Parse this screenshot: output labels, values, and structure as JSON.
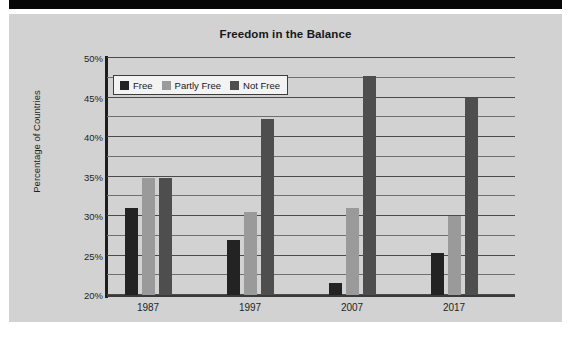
{
  "chart_data": {
    "type": "bar",
    "title": "Freedom in the Balance",
    "xlabel": "",
    "ylabel": "Percentage of Countries",
    "categories": [
      "1987",
      "1997",
      "2007",
      "2017"
    ],
    "series": [
      {
        "name": "Free",
        "color": "#232323",
        "values": [
          31.0,
          27.0,
          21.5,
          25.3
        ]
      },
      {
        "name": "Partly Free",
        "color": "#9a9a9a",
        "values": [
          34.8,
          30.5,
          31.0,
          30.0
        ]
      },
      {
        "name": "Not Free",
        "color": "#4e4e4e",
        "values": [
          34.8,
          42.3,
          47.7,
          45.0
        ]
      }
    ],
    "ylim": [
      20,
      50
    ],
    "ytick_labels": [
      "20%",
      "25%",
      "30%",
      "35%",
      "40%",
      "45%",
      "50%"
    ],
    "ytick_values": [
      20,
      25,
      30,
      35,
      40,
      45,
      50
    ],
    "gridline_values": [
      20,
      22.5,
      25,
      27.5,
      30,
      32.5,
      35,
      37.5,
      40,
      42.5,
      45,
      47.5,
      50
    ],
    "grid": true,
    "legend_position": "top-left"
  },
  "legend": {
    "items": [
      {
        "label": "Free"
      },
      {
        "label": "Partly Free"
      },
      {
        "label": "Not Free"
      }
    ]
  }
}
